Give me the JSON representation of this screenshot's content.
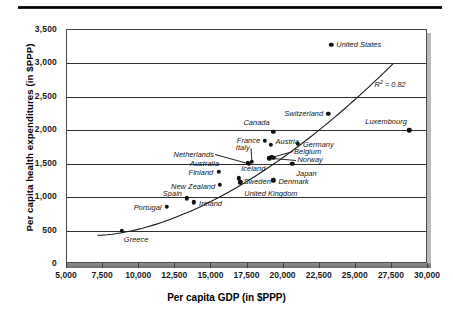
{
  "chart_data": {
    "type": "scatter",
    "title": "",
    "xlabel": "Per capita GDP (in $PPP)",
    "ylabel": "Per capita health expenditures (in $PPP)",
    "xlim": [
      5000,
      30000
    ],
    "ylim": [
      0,
      3500
    ],
    "xticks": [
      "5,000",
      "7,500",
      "10,000",
      "12,500",
      "15,000",
      "17,500",
      "20,000",
      "22,500",
      "25,000",
      "27,500",
      "30,000"
    ],
    "yticks": [
      "0",
      "500",
      "1,000",
      "1,500",
      "2,000",
      "2,500",
      "3,000",
      "3,500"
    ],
    "grid": "horizontal",
    "legend": "none",
    "annotation": "R² = 0.82",
    "annotation_r2_value": 0.82,
    "trendline": {
      "type": "fitted-curve",
      "x_start": 7100,
      "y_start": 430,
      "x_end": 27600,
      "y_end": 3000
    },
    "points": [
      {
        "name": "Greece",
        "x": 8800,
        "y": 500,
        "label_dx": 2,
        "label_dy": 9,
        "anchor": "start"
      },
      {
        "name": "Portugal",
        "x": 11900,
        "y": 860,
        "label_dx": -5,
        "label_dy": 1,
        "anchor": "end"
      },
      {
        "name": "Spain",
        "x": 13300,
        "y": 980,
        "label_dx": -5,
        "label_dy": -5,
        "anchor": "end"
      },
      {
        "name": "Ireland",
        "x": 13800,
        "y": 920,
        "label_dx": 5,
        "label_dy": 1,
        "anchor": "start"
      },
      {
        "name": "Finland",
        "x": 15500,
        "y": 1380,
        "label_dx": -5,
        "label_dy": 1,
        "anchor": "end"
      },
      {
        "name": "New Zealand",
        "x": 15600,
        "y": 1180,
        "label_dx": -5,
        "label_dy": 1,
        "anchor": "end"
      },
      {
        "name": "Sweden",
        "x": 16900,
        "y": 1280,
        "label_dx": 5,
        "label_dy": 3,
        "anchor": "start"
      },
      {
        "name": "United Kingdom",
        "x": 17000,
        "y": 1220,
        "label_dx": 4,
        "label_dy": 11,
        "anchor": "start"
      },
      {
        "name": "Netherlands",
        "x": 17500,
        "y": 1510,
        "label_dx": -34,
        "label_dy": -9,
        "anchor": "end",
        "leader": true
      },
      {
        "name": "Australia",
        "x": 17600,
        "y": 1500,
        "label_dx": -30,
        "label_dy": 0,
        "anchor": "end",
        "leader": true
      },
      {
        "name": "Italy",
        "x": 17800,
        "y": 1530,
        "label_dx": -2,
        "label_dy": -14,
        "anchor": "end",
        "leader": true
      },
      {
        "name": "France",
        "x": 18700,
        "y": 1840,
        "label_dx": -5,
        "label_dy": 0,
        "anchor": "end"
      },
      {
        "name": "Austria",
        "x": 19100,
        "y": 1780,
        "label_dx": 5,
        "label_dy": -3,
        "anchor": "start"
      },
      {
        "name": "Canada",
        "x": 19300,
        "y": 1980,
        "label_dx": -4,
        "label_dy": -9,
        "anchor": "end"
      },
      {
        "name": "Iceland",
        "x": 19000,
        "y": 1580,
        "label_dx": -4,
        "label_dy": 10,
        "anchor": "end"
      },
      {
        "name": "Belgium",
        "x": 19200,
        "y": 1600,
        "label_dx": 22,
        "label_dy": -6,
        "anchor": "start",
        "leader": true
      },
      {
        "name": "Norway",
        "x": 19300,
        "y": 1590,
        "label_dx": 24,
        "label_dy": 2,
        "anchor": "start",
        "leader": true
      },
      {
        "name": "Denmark",
        "x": 19300,
        "y": 1250,
        "label_dx": 5,
        "label_dy": 1,
        "anchor": "start"
      },
      {
        "name": "Japan",
        "x": 20600,
        "y": 1500,
        "label_dx": 4,
        "label_dy": 10,
        "anchor": "start"
      },
      {
        "name": "Germany",
        "x": 21000,
        "y": 1800,
        "label_dx": 5,
        "label_dy": 1,
        "anchor": "start"
      },
      {
        "name": "Switzerland",
        "x": 23100,
        "y": 2250,
        "label_dx": -5,
        "label_dy": 0,
        "anchor": "end"
      },
      {
        "name": "United States",
        "x": 23300,
        "y": 3280,
        "label_dx": 5,
        "label_dy": 0,
        "anchor": "start"
      },
      {
        "name": "Luxembourg",
        "x": 28700,
        "y": 2000,
        "label_dx": -2,
        "label_dy": -9,
        "anchor": "end"
      }
    ]
  }
}
